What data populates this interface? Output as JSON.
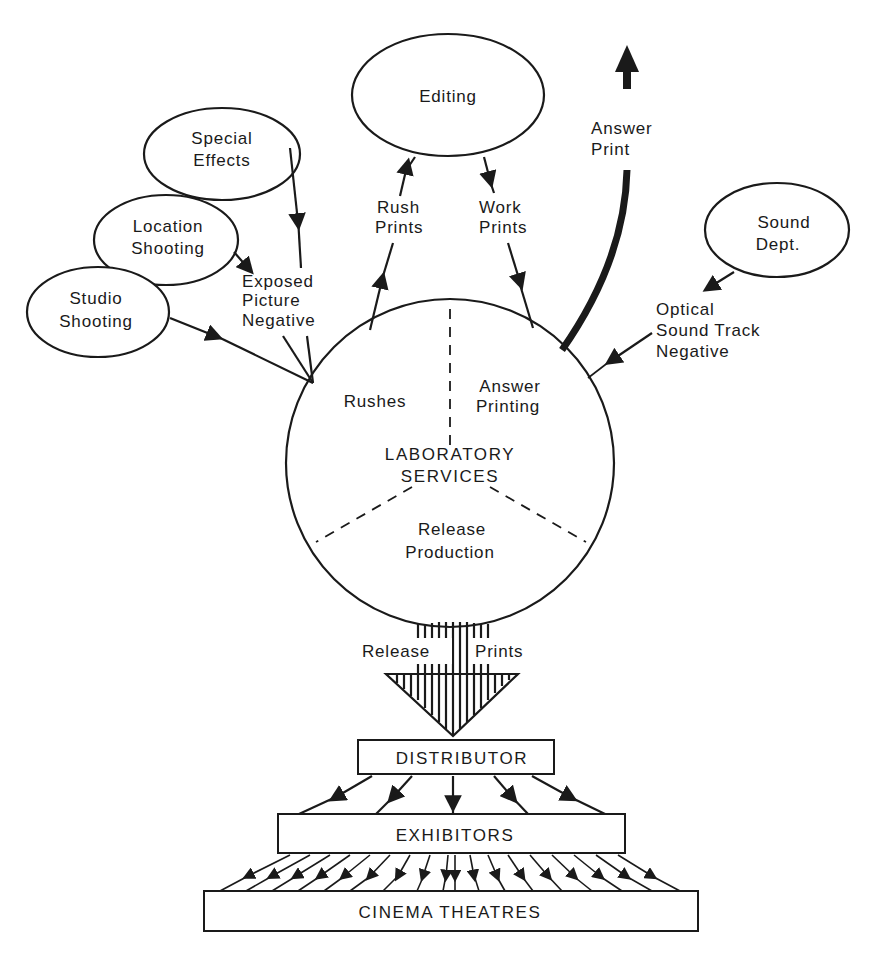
{
  "diagram": {
    "type": "flowchart",
    "center": {
      "title_line1": "LABORATORY",
      "title_line2": "SERVICES",
      "sectors": [
        {
          "label_line1": "Rushes",
          "label_line2": ""
        },
        {
          "label_line1": "Answer",
          "label_line2": "Printing"
        },
        {
          "label_line1": "Release",
          "label_line2": "Production"
        }
      ]
    },
    "sources": [
      {
        "id": "special_effects",
        "line1": "Special",
        "line2": "Effects"
      },
      {
        "id": "location_shooting",
        "line1": "Location",
        "line2": "Shooting"
      },
      {
        "id": "studio_shooting",
        "line1": "Studio",
        "line2": "Shooting"
      },
      {
        "id": "editing",
        "line1": "Editing",
        "line2": ""
      },
      {
        "id": "sound_dept",
        "line1": "Sound",
        "line2": "Dept."
      }
    ],
    "flow_labels": {
      "exposed_negative": [
        "Exposed",
        "Picture",
        "Negative"
      ],
      "rush_prints": [
        "Rush",
        "Prints"
      ],
      "work_prints": [
        "Work",
        "Prints"
      ],
      "answer_print": [
        "Answer",
        "Print"
      ],
      "optical_sound": [
        "Optical",
        "Sound Track",
        "Negative"
      ],
      "release_left": "Release",
      "release_right": "Prints"
    },
    "boxes": {
      "distributor": "DISTRIBUTOR",
      "exhibitors": "EXHIBITORS",
      "cinemas": "CINEMA THEATRES"
    },
    "edges": [
      {
        "from": "Special Effects",
        "to": "Laboratory Services",
        "label": "Exposed Picture Negative"
      },
      {
        "from": "Location Shooting",
        "to": "Laboratory Services",
        "label": "Exposed Picture Negative"
      },
      {
        "from": "Studio Shooting",
        "to": "Laboratory Services",
        "label": "Exposed Picture Negative"
      },
      {
        "from": "Laboratory Services",
        "to": "Editing",
        "label": "Rush Prints"
      },
      {
        "from": "Editing",
        "to": "Laboratory Services",
        "label": "Work Prints"
      },
      {
        "from": "Laboratory Services",
        "to": "(out)",
        "label": "Answer Print"
      },
      {
        "from": "Sound Dept.",
        "to": "Laboratory Services",
        "label": "Optical Sound Track Negative"
      },
      {
        "from": "Laboratory Services",
        "to": "Distributor",
        "label": "Release Prints"
      },
      {
        "from": "Distributor",
        "to": "Exhibitors",
        "count": 5
      },
      {
        "from": "Exhibitors",
        "to": "Cinema Theatres",
        "count": 18
      }
    ]
  }
}
